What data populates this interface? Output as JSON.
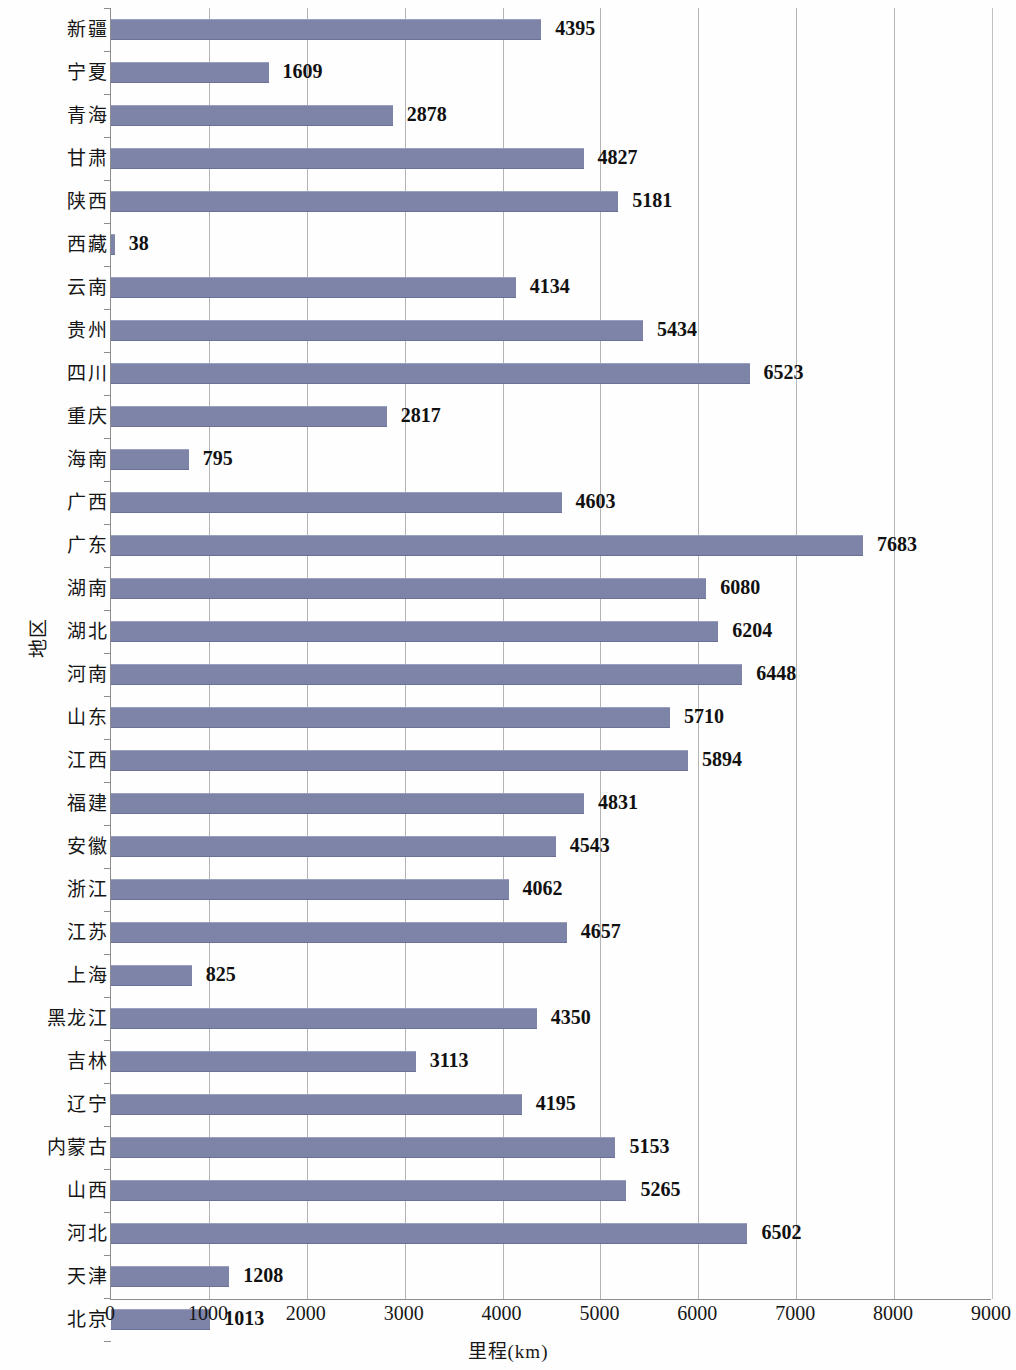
{
  "chart_data": {
    "type": "bar",
    "orientation": "horizontal",
    "title": "",
    "xlabel": "里程(km)",
    "ylabel": "地区",
    "xlim": [
      0,
      9000
    ],
    "xticks": [
      0,
      1000,
      2000,
      3000,
      4000,
      5000,
      6000,
      7000,
      8000,
      9000
    ],
    "grid": true,
    "legend": false,
    "bar_color": "#7e83a8",
    "categories": [
      "新疆",
      "宁夏",
      "青海",
      "甘肃",
      "陕西",
      "西藏",
      "云南",
      "贵州",
      "四川",
      "重庆",
      "海南",
      "广西",
      "广东",
      "湖南",
      "湖北",
      "河南",
      "山东",
      "江西",
      "福建",
      "安徽",
      "浙江",
      "江苏",
      "上海",
      "黑龙江",
      "吉林",
      "辽宁",
      "内蒙古",
      "山西",
      "河北",
      "天津",
      "北京"
    ],
    "values": [
      4395,
      1609,
      2878,
      4827,
      5181,
      38,
      4134,
      5434,
      6523,
      2817,
      795,
      4603,
      7683,
      6080,
      6204,
      6448,
      5710,
      5894,
      4831,
      4543,
      4062,
      4657,
      825,
      4350,
      3113,
      4195,
      5153,
      5265,
      6502,
      1208,
      1013
    ],
    "labels": [
      "4395",
      "1609",
      "2878",
      "4827",
      "5181",
      "38",
      "4134",
      "5434",
      "6523",
      "2817",
      "795",
      "4603",
      "7683",
      "6080",
      "6204",
      "6448",
      "5710",
      "5894",
      "4831",
      "4543",
      "4062",
      "4657",
      "825",
      "4350",
      "3113",
      "4195",
      "5153",
      "5265",
      "6502",
      "1208",
      "1013"
    ]
  }
}
